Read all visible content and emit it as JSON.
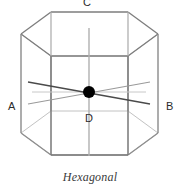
{
  "figure": {
    "caption": "Hexagonal",
    "type": "hexagonal-prism-wireframe",
    "background_color": "#ffffff"
  },
  "labels": {
    "c_axis": "C",
    "a_axis": "A",
    "b_axis": "B",
    "d_axis": "D"
  },
  "colors": {
    "edge_dark": "#6f6f6f",
    "edge_mid": "#8a8a8a",
    "edge_light": "#c2c2c2",
    "axis_dark": "#555555",
    "axis_light": "#b5b5b5",
    "origin_dot": "#000000",
    "label_text": "#2b2b2b",
    "caption_text": "#3a3a3a"
  },
  "geometry": {
    "origin": {
      "x": 89,
      "y": 92,
      "radius": 6
    },
    "top_hexagon": [
      {
        "x": 51,
        "y": 12
      },
      {
        "x": 128,
        "y": 12
      },
      {
        "x": 158,
        "y": 34
      },
      {
        "x": 128,
        "y": 56
      },
      {
        "x": 51,
        "y": 56
      },
      {
        "x": 21,
        "y": 34
      }
    ],
    "bottom_hexagon": [
      {
        "x": 51,
        "y": 111
      },
      {
        "x": 128,
        "y": 111
      },
      {
        "x": 158,
        "y": 133
      },
      {
        "x": 128,
        "y": 155
      },
      {
        "x": 51,
        "y": 155
      },
      {
        "x": 21,
        "y": 133
      }
    ],
    "vertical_edges": [
      {
        "x": 21,
        "y1": 34,
        "y2": 133
      },
      {
        "x": 51,
        "y1": 12,
        "y2": 111
      },
      {
        "x": 128,
        "y1": 12,
        "y2": 111
      },
      {
        "x": 158,
        "y1": 34,
        "y2": 133
      },
      {
        "x": 51,
        "y1": 56,
        "y2": 155
      },
      {
        "x": 128,
        "y1": 56,
        "y2": 155
      }
    ],
    "axes": [
      {
        "name": "c-axis-vertical",
        "x1": 89,
        "y1": 28,
        "x2": 89,
        "y2": 156
      },
      {
        "name": "a-axis",
        "x1": 28,
        "y1": 82,
        "x2": 150,
        "y2": 104
      },
      {
        "name": "b-axis",
        "x1": 28,
        "y1": 104,
        "x2": 150,
        "y2": 82
      },
      {
        "name": "d-axis",
        "x1": 32,
        "y1": 92,
        "x2": 146,
        "y2": 92
      }
    ]
  }
}
